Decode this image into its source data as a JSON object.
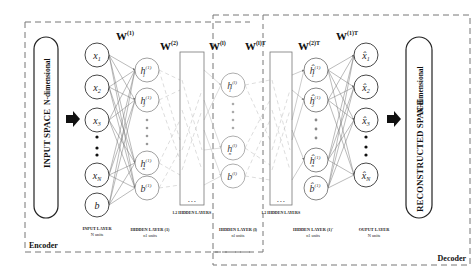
{
  "diagram": {
    "type": "autoencoder-architecture",
    "regions": {
      "encoder_label": "Encoder",
      "decoder_label": "Decoder"
    },
    "input_space": {
      "title": "INPUT SPACE",
      "subtitle": "N-dimensional"
    },
    "reconstructed_space": {
      "title": "RECONSTRUCTED SPACE",
      "subtitle": "N-dimensional"
    },
    "weights": {
      "w1": "W",
      "w1_sup": "(1)",
      "w2": "W",
      "w2_sup": "(2)",
      "wl": "W",
      "wl_sup": "(l)",
      "wlT": "W",
      "wlT_sup": "(l)T",
      "w2T": "W",
      "w2T_sup": "(2)T",
      "w1T": "W",
      "w1T_sup": "(1)T"
    },
    "layers": {
      "input": {
        "label": "INPUT LAYER",
        "units": "N units",
        "nodes": [
          "x1",
          "x2",
          "x3",
          "xN",
          "b"
        ]
      },
      "hidden1": {
        "label": "HIDDEN LAYER (1)",
        "units": "n1 units",
        "nodes": [
          "h1(1)",
          "h2(1)",
          "hn1(1)",
          "b(1)"
        ]
      },
      "hidden_block_enc": {
        "label": "l-2 HIDDEN LAYERS",
        "ellipsis": "• • •"
      },
      "hidden_l": {
        "label": "HIDDEN LAYER (l)",
        "units": "nl units",
        "nodes": [
          "h1(l)",
          "hnl(l)",
          "b(l)"
        ]
      },
      "hidden_block_dec": {
        "label": "l-2 HIDDEN LAYERS",
        "ellipsis": "• • •"
      },
      "hidden1_prime": {
        "label": "HIDDEN LAYER (1)'",
        "units": "n1 units",
        "nodes": [
          "ĥ1(1)",
          "ĥ2(1)",
          "ĥn1(1)",
          "b̂(1)"
        ]
      },
      "output": {
        "label": "OUPUT LAYER",
        "units": "N units",
        "nodes": [
          "x̂1",
          "x̂2",
          "x̂3",
          "x̂N"
        ]
      }
    },
    "colors": {
      "line": "#555555",
      "light_line": "#bbbbbb",
      "node_stroke": "#444444",
      "dashed": "#777777",
      "text": "#111111"
    }
  }
}
